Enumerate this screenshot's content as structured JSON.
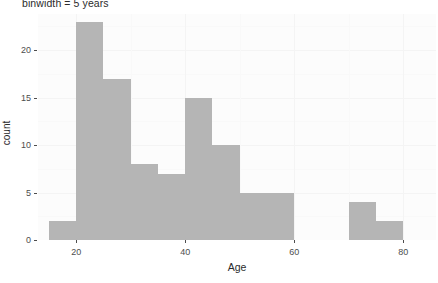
{
  "chart_data": {
    "type": "bar",
    "title": "binwidth = 5 years",
    "xlabel": "Age",
    "ylabel": "count",
    "xlim": [
      13,
      86
    ],
    "ylim": [
      0,
      23.8
    ],
    "grid": true,
    "legend": "none",
    "bar_color": "#b5b5b5",
    "panel_background": "#fcfcfc",
    "binwidth": 5,
    "xticks": [
      20,
      40,
      60,
      80
    ],
    "xtick_labels": [
      "20",
      "40",
      "60",
      "80"
    ],
    "yticks": [
      0,
      5,
      10,
      15,
      20
    ],
    "ytick_labels": [
      "0",
      "5",
      "10",
      "15",
      "20"
    ],
    "bins": [
      {
        "label": "15-20",
        "x0": 15,
        "x1": 20,
        "count": 2
      },
      {
        "label": "20-25",
        "x0": 20,
        "x1": 25,
        "count": 23
      },
      {
        "label": "25-30",
        "x0": 25,
        "x1": 30,
        "count": 17
      },
      {
        "label": "30-35",
        "x0": 30,
        "x1": 35,
        "count": 8
      },
      {
        "label": "35-40",
        "x0": 35,
        "x1": 40,
        "count": 7
      },
      {
        "label": "40-45",
        "x0": 40,
        "x1": 45,
        "count": 15
      },
      {
        "label": "45-50",
        "x0": 45,
        "x1": 50,
        "count": 10
      },
      {
        "label": "50-55",
        "x0": 50,
        "x1": 55,
        "count": 5
      },
      {
        "label": "55-60",
        "x0": 55,
        "x1": 60,
        "count": 5
      },
      {
        "label": "70-75",
        "x0": 70,
        "x1": 75,
        "count": 4
      },
      {
        "label": "75-80",
        "x0": 75,
        "x1": 80,
        "count": 2
      }
    ],
    "categories": [
      "15-20",
      "20-25",
      "25-30",
      "30-35",
      "35-40",
      "40-45",
      "45-50",
      "50-55",
      "55-60",
      "70-75",
      "75-80"
    ],
    "values": [
      2,
      23,
      17,
      8,
      7,
      15,
      10,
      5,
      5,
      4,
      2
    ]
  }
}
